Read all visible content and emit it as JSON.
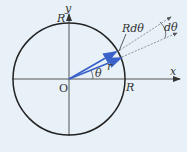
{
  "diagram": {
    "labels": {
      "y_axis": "y",
      "x_axis": "x",
      "origin": "O",
      "radius_top": "R",
      "radius_right": "R",
      "arc": "Rdθ",
      "angle": "θ",
      "vector": "r",
      "dtheta": "dθ"
    },
    "colors": {
      "background": "#e8f1f8",
      "circle": "#222222",
      "axes": "#444444",
      "vectors": "#3a62c8",
      "dashed": "#777777"
    }
  }
}
